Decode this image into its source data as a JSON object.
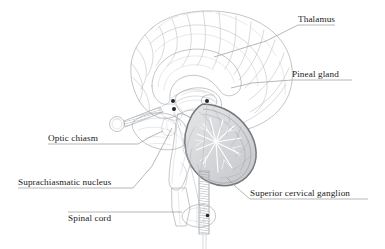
{
  "figure": {
    "type": "anatomical-illustration",
    "background_color": "#ffffff",
    "width": 385,
    "height": 249,
    "ink_color": "#a3a7ac",
    "label_color": "#1a1a1a",
    "leader_color": "#9a9a9a",
    "marker_color": "#23262a"
  },
  "labels": [
    {
      "id": "thalamus",
      "text": "Thalamus",
      "text_x": 298,
      "text_y": 22,
      "anchor": "start",
      "leader": "M 298 25 L 335 25 M 298 25 L 266 41 L 214 57"
    },
    {
      "id": "pineal-gland",
      "text": "Pineal gland",
      "text_x": 292,
      "text_y": 77,
      "anchor": "start",
      "leader": "M 292 80 L 352 80 M 292 80 L 252 83 L 231 88"
    },
    {
      "id": "optic-chiasm",
      "text": "Optic chiasm",
      "text_x": 48,
      "text_y": 141,
      "anchor": "start",
      "leader": "M 48 144 L 138 144 L 152 136 L 163 131"
    },
    {
      "id": "suprachiasmatic-nucleus",
      "text": "Suprachiasmatic nucleus",
      "text_x": 18,
      "text_y": 185,
      "anchor": "start",
      "leader": "M 18 188 L 133 188 L 152 166 L 172 128"
    },
    {
      "id": "spinal-cord",
      "text": "Spinal cord",
      "text_x": 68,
      "text_y": 221,
      "anchor": "start",
      "leader": "M 68 212 L 182 212"
    },
    {
      "id": "superior-cervical-ganglion",
      "text": "Superior cervical ganglion",
      "text_x": 250,
      "text_y": 196,
      "anchor": "start",
      "leader": "M 250 199 L 368 199 M 250 199 L 236 187 L 227 178"
    }
  ],
  "markers": [
    {
      "id": "thalamus-marker",
      "cx": 173.0,
      "cy": 101.0,
      "r": 2.0
    },
    {
      "id": "suprachiasmatic-marker",
      "cx": 174.0,
      "cy": 109.0,
      "r": 2.0
    },
    {
      "id": "pineal-marker",
      "cx": 207.0,
      "cy": 101.0,
      "r": 2.0
    },
    {
      "id": "spinal-cord-marker",
      "cx": 207.5,
      "cy": 215.5,
      "r": 1.8
    }
  ],
  "structures": [
    {
      "id": "cerebral-cortex",
      "name": "Cerebral cortex (gyri and sulci)"
    },
    {
      "id": "corpus-callosum",
      "name": "Corpus callosum"
    },
    {
      "id": "thalamus-body",
      "name": "Thalamus"
    },
    {
      "id": "pineal-body",
      "name": "Pineal gland"
    },
    {
      "id": "optic-nerve",
      "name": "Optic nerve and chiasm"
    },
    {
      "id": "eyeball",
      "name": "Eyeball"
    },
    {
      "id": "cerebellum",
      "name": "Cerebellum with arbor vitae"
    },
    {
      "id": "brainstem",
      "name": "Brainstem"
    },
    {
      "id": "temporal-lobe",
      "name": "Temporal lobe"
    },
    {
      "id": "spinal-cord-section",
      "name": "Spinal cord cross-section"
    },
    {
      "id": "sympathetic-chain",
      "name": "Sympathetic chain / cervical cord"
    }
  ]
}
